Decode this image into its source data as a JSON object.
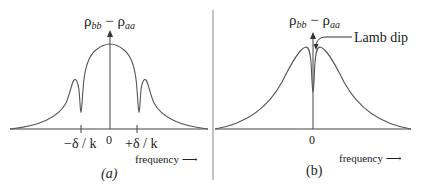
{
  "figure": {
    "panels": [
      {
        "id": "a",
        "caption": "(a)",
        "ylabel": {
          "main1": "ρ",
          "sub1": "bb",
          "dash": " − ",
          "main2": "ρ",
          "sub2": "aa"
        },
        "zero_label": "0",
        "tick_labels": [
          "−δ / k",
          "+δ / k"
        ],
        "xlabel": "frequency ⟶",
        "description": "Broad Doppler profile with two narrow holes burned at ±δ/k"
      },
      {
        "id": "b",
        "caption": "(b)",
        "ylabel": {
          "main1": "ρ",
          "sub1": "bb",
          "dash": " − ",
          "main2": "ρ",
          "sub2": "aa"
        },
        "zero_label": "0",
        "annotation": "Lamb dip",
        "xlabel": "frequency ⟶",
        "description": "Broad Doppler profile with single narrow dip at line center"
      }
    ],
    "colors": {
      "curve": "#555555",
      "axis": "#444444",
      "divider": "#999999",
      "text": "#222222"
    }
  }
}
